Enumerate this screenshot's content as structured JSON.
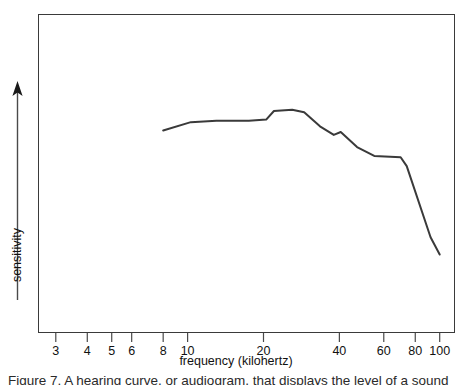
{
  "figure": {
    "caption": "Figure 7. A hearing curve, or audiogram, that displays the level of a sound"
  },
  "chart_data": {
    "type": "line",
    "title": "",
    "xlabel": "frequency (kilohertz)",
    "ylabel": "sensitivity",
    "xscale": "log",
    "xlim": [
      2.55,
      115
    ],
    "ylim": [
      0,
      1
    ],
    "grid": false,
    "legend": null,
    "xticks": [
      3,
      4,
      5,
      6,
      8,
      10,
      20,
      40,
      60,
      80,
      100
    ],
    "xtick_labels": [
      "3",
      "4",
      "5",
      "6",
      "8",
      "10",
      "20",
      "40",
      "60",
      "80",
      "100"
    ],
    "ytick_labels": [],
    "y_axis_style": "arrow-up-unscaled",
    "series": [
      {
        "name": "sensitivity",
        "color": "#3a3a3a",
        "x": [
          8.0,
          10.3,
          13.0,
          17.5,
          20.5,
          22.0,
          26.0,
          29.0,
          33.5,
          38.0,
          40.5,
          47.0,
          55.0,
          70.0,
          74.0,
          92.0,
          100.0
        ],
        "y": [
          0.635,
          0.661,
          0.665,
          0.665,
          0.669,
          0.696,
          0.7,
          0.692,
          0.648,
          0.621,
          0.63,
          0.583,
          0.555,
          0.551,
          0.523,
          0.3,
          0.246
        ]
      }
    ],
    "annotations": []
  }
}
